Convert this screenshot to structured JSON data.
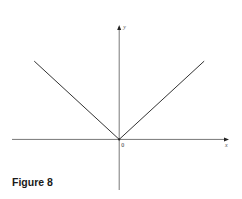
{
  "chart_data": {
    "type": "line",
    "title": "",
    "caption": "Figure 8",
    "function": "y = |x|",
    "xlabel": "x",
    "ylabel": "y",
    "origin_label": "0",
    "xlim": [
      -4.1,
      4.2
    ],
    "ylim": [
      -2.1,
      4.75
    ],
    "grid": false,
    "legend": "none",
    "series": [
      {
        "name": "left-branch",
        "x": [
          -3.25,
          0
        ],
        "y": [
          3.25,
          0
        ]
      },
      {
        "name": "right-branch",
        "x": [
          0,
          3.25
        ],
        "y": [
          0,
          3.25
        ]
      }
    ]
  }
}
